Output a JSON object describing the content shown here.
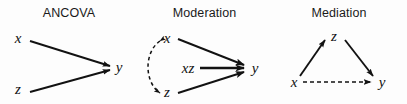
{
  "figure": {
    "background_color": "#fdfdfd",
    "stroke_color": "#121212",
    "panels": [
      {
        "id": "ancova",
        "title": "ANCOVA",
        "nodes": [
          {
            "id": "x",
            "label": "x",
            "x": 18,
            "y": 43
          },
          {
            "id": "z",
            "label": "z",
            "x": 18,
            "y": 94
          },
          {
            "id": "y",
            "label": "y",
            "x": 119,
            "y": 70
          }
        ],
        "edges": [
          {
            "from": "x",
            "to": "y",
            "style": "solid",
            "arrow": "single"
          },
          {
            "from": "z",
            "to": "y",
            "style": "solid",
            "arrow": "single"
          }
        ]
      },
      {
        "id": "moderation",
        "title": "Moderation",
        "nodes": [
          {
            "id": "x",
            "label": "x",
            "x": 28,
            "y": 40
          },
          {
            "id": "z",
            "label": "z",
            "x": 28,
            "y": 94
          },
          {
            "id": "xz",
            "label": "xz",
            "x": 48,
            "y": 72
          },
          {
            "id": "y",
            "label": "y",
            "x": 117,
            "y": 70
          }
        ],
        "edges": [
          {
            "from": "x",
            "to": "y",
            "style": "solid",
            "arrow": "single"
          },
          {
            "from": "z",
            "to": "y",
            "style": "solid",
            "arrow": "single"
          },
          {
            "from": "xz",
            "to": "y",
            "style": "thick",
            "arrow": "single"
          },
          {
            "from": "x",
            "to": "z",
            "style": "dashed-arc",
            "arrow": "double"
          }
        ]
      },
      {
        "id": "mediation",
        "title": "Mediation",
        "nodes": [
          {
            "id": "z",
            "label": "z",
            "x": 62,
            "y": 43
          },
          {
            "id": "x",
            "label": "x",
            "x": 22,
            "y": 84
          },
          {
            "id": "y",
            "label": "y",
            "x": 110,
            "y": 84
          }
        ],
        "edges": [
          {
            "from": "x",
            "to": "z",
            "style": "solid",
            "arrow": "single"
          },
          {
            "from": "z",
            "to": "y",
            "style": "solid",
            "arrow": "single"
          },
          {
            "from": "x",
            "to": "y",
            "style": "dashed",
            "arrow": "single"
          }
        ]
      }
    ]
  }
}
